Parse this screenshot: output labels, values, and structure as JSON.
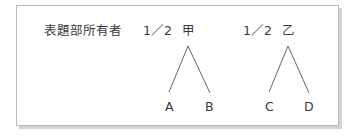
{
  "diagram": {
    "row_label": "表題部所有者",
    "owners": [
      {
        "share": "1／2",
        "name": "甲",
        "heirs": [
          "A",
          "B"
        ]
      },
      {
        "share": "1／2",
        "name": "乙",
        "heirs": [
          "C",
          "D"
        ]
      }
    ],
    "colors": {
      "text": "#3a3a3a",
      "line": "#555555",
      "border": "#b8b8b8",
      "shadow": "#d4d4d4"
    }
  }
}
